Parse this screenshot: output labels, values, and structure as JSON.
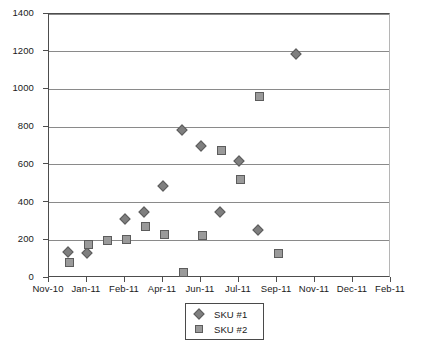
{
  "chart_data": {
    "type": "scatter",
    "title": "",
    "xlabel": "",
    "ylabel": "",
    "ylim": [
      0,
      1400
    ],
    "ytick_values": [
      0,
      200,
      400,
      600,
      800,
      1000,
      1200,
      1400
    ],
    "ytick_labels": [
      "0",
      "200",
      "400",
      "600",
      "800",
      "1000",
      "1200",
      "1400"
    ],
    "xtick_labels": [
      "Nov-10",
      "Jan-11",
      "Feb-11",
      "Apr-11",
      "Jun-11",
      "Jul-11",
      "Sep-11",
      "Nov-11",
      "Dec-11",
      "Feb-11"
    ],
    "grid": "horizontal",
    "legend_position": "bottom-center",
    "series": [
      {
        "name": "SKU #1",
        "marker": "diamond",
        "color": "#7f7f7f",
        "points": [
          {
            "x": 0.55,
            "y": 130
          },
          {
            "x": 1.05,
            "y": 125
          },
          {
            "x": 2.05,
            "y": 305
          },
          {
            "x": 2.55,
            "y": 340
          },
          {
            "x": 3.05,
            "y": 480
          },
          {
            "x": 3.55,
            "y": 775
          },
          {
            "x": 4.05,
            "y": 690
          },
          {
            "x": 4.55,
            "y": 340
          },
          {
            "x": 5.05,
            "y": 610
          },
          {
            "x": 5.55,
            "y": 245
          },
          {
            "x": 6.55,
            "y": 1180
          }
        ]
      },
      {
        "name": "SKU #2",
        "marker": "square",
        "color": "#9a9a9a",
        "points": [
          {
            "x": 0.55,
            "y": 80
          },
          {
            "x": 1.05,
            "y": 180
          },
          {
            "x": 1.55,
            "y": 200
          },
          {
            "x": 2.05,
            "y": 205
          },
          {
            "x": 2.55,
            "y": 275
          },
          {
            "x": 3.05,
            "y": 230
          },
          {
            "x": 3.55,
            "y": 30
          },
          {
            "x": 4.05,
            "y": 225
          },
          {
            "x": 4.55,
            "y": 675
          },
          {
            "x": 5.05,
            "y": 520
          },
          {
            "x": 5.55,
            "y": 965
          },
          {
            "x": 6.05,
            "y": 130
          }
        ]
      }
    ]
  },
  "legend": {
    "entries": [
      {
        "label": "SKU #1"
      },
      {
        "label": "SKU #2"
      }
    ]
  }
}
